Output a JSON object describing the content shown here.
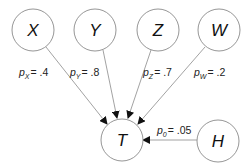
{
  "diagram": {
    "nodes": [
      {
        "id": "X",
        "label": "X"
      },
      {
        "id": "Y",
        "label": "Y"
      },
      {
        "id": "Z",
        "label": "Z"
      },
      {
        "id": "W",
        "label": "W"
      },
      {
        "id": "T",
        "label": "T"
      },
      {
        "id": "H",
        "label": "H"
      }
    ],
    "edges": [
      {
        "from": "X",
        "to": "T",
        "prob_var": "p",
        "prob_sub": "X",
        "prob_value": "= .4"
      },
      {
        "from": "Y",
        "to": "T",
        "prob_var": "p",
        "prob_sub": "Y",
        "prob_value": "= .8"
      },
      {
        "from": "Z",
        "to": "T",
        "prob_var": "p",
        "prob_sub": "Z",
        "prob_value": "= .7"
      },
      {
        "from": "W",
        "to": "T",
        "prob_var": "p",
        "prob_sub": "W",
        "prob_value": "= .2"
      },
      {
        "from": "H",
        "to": "T",
        "prob_var": "p",
        "prob_sub": "0",
        "prob_value": "= .05"
      }
    ]
  }
}
